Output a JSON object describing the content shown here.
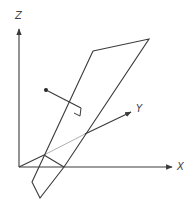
{
  "diagram": {
    "axes": {
      "z": {
        "label": "Z"
      },
      "x": {
        "label": "X"
      },
      "y": {
        "label": "Y"
      }
    },
    "colors": {
      "line": "#3a3a3a",
      "hidden_line": "#b0b0b0",
      "label": "#444444",
      "background": "#ffffff"
    }
  }
}
